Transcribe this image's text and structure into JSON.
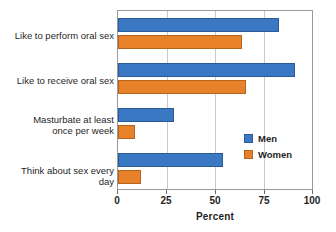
{
  "chart_data": {
    "type": "bar",
    "orientation": "horizontal",
    "title": "",
    "xlabel": "Percent",
    "ylabel": "",
    "xlim": [
      0,
      100
    ],
    "xticks": [
      0,
      25,
      50,
      75,
      100
    ],
    "xtick_labels": [
      "0",
      "25",
      "50",
      "75",
      "100"
    ],
    "grid": true,
    "grid_axis": "x",
    "legend_position": "right-inside",
    "categories": [
      "Like to perform oral sex",
      "Like to receive oral sex",
      "Masturbate at least once per week",
      "Think about sex every day"
    ],
    "category_label_lines": [
      [
        "Like to perform oral sex"
      ],
      [
        "Like to receive oral sex"
      ],
      [
        "Masturbate at least",
        "once per week"
      ],
      [
        "Think about sex every day"
      ]
    ],
    "series": [
      {
        "name": "Men",
        "color": "#3b78c3",
        "values": [
          83,
          91,
          29,
          54
        ]
      },
      {
        "name": "Women",
        "color": "#e8822a",
        "values": [
          64,
          66,
          9,
          12
        ]
      }
    ]
  },
  "legend": {
    "items": [
      {
        "label": "Men"
      },
      {
        "label": "Women"
      }
    ]
  },
  "axis": {
    "x_title": "Percent",
    "ticks": [
      "0",
      "25",
      "50",
      "75",
      "100"
    ]
  },
  "colors": {
    "men": "#3b78c3",
    "women": "#e8822a",
    "frame": "#9a9a9a",
    "grid": "#c9c9c9",
    "background": "#ffffff",
    "text": "#1f1f1f"
  }
}
